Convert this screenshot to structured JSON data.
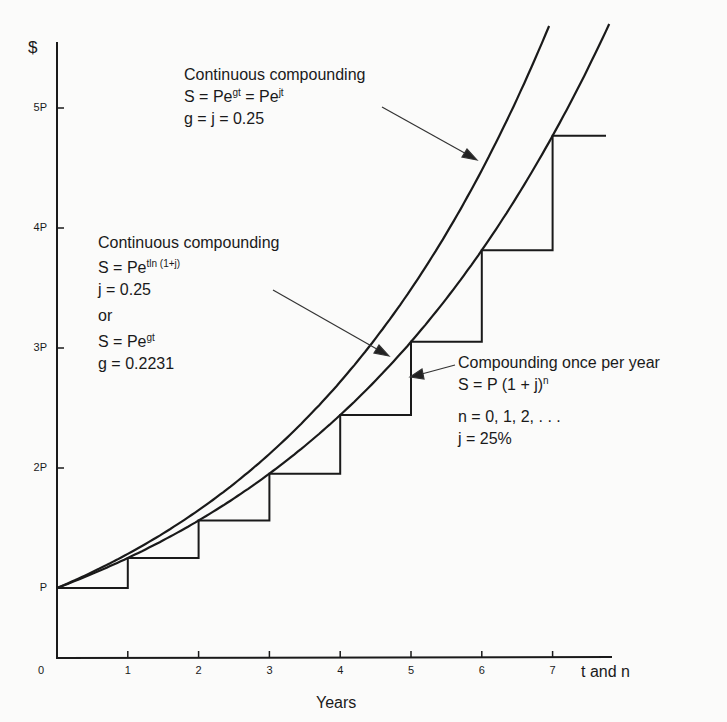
{
  "chart_data": {
    "type": "line",
    "title": "",
    "xlabel": "Years",
    "x_axis_end_label": "t and n",
    "ylabel": "$",
    "x_ticks": [
      "0",
      "1",
      "2",
      "3",
      "4",
      "5",
      "6",
      "7"
    ],
    "y_ticks": [
      "P",
      "2P",
      "3P",
      "4P",
      "5P"
    ],
    "y_units": "multiples of principal P",
    "grid": false,
    "series": [
      {
        "name": "Continuous compounding, g = j = 0.25",
        "formula": "S = Pe^gt = Pe^jt",
        "style": "smooth curve",
        "x": [
          0,
          1,
          2,
          3,
          4,
          5,
          6,
          7
        ],
        "values": [
          1.0,
          1.284,
          1.649,
          2.117,
          2.718,
          3.49,
          4.482,
          5.755
        ]
      },
      {
        "name": "Continuous compounding, g = 0.2231 (j = 0.25)",
        "formula": "S = Pe^(t ln(1+j)) = Pe^gt",
        "style": "smooth curve",
        "x": [
          0,
          1,
          2,
          3,
          4,
          5,
          6,
          7,
          7.8
        ],
        "values": [
          1.0,
          1.25,
          1.5625,
          1.953,
          2.441,
          3.052,
          3.815,
          4.768,
          5.7
        ]
      },
      {
        "name": "Compounding once per year, j = 25%",
        "formula": "S = P(1 + j)^n",
        "style": "step",
        "x": [
          0,
          1,
          2,
          3,
          4,
          5,
          6,
          7
        ],
        "values": [
          1.0,
          1.25,
          1.5625,
          1.953,
          2.441,
          3.052,
          3.815,
          4.768
        ]
      }
    ],
    "annotations": [
      {
        "lines": [
          "Continuous compounding",
          "S = Pe^gt = Pe^jt",
          "g = j = 0.25"
        ],
        "points_to": "upper curve"
      },
      {
        "lines": [
          "Continuous compounding",
          "S = Pe^(t ln(1+j))",
          "j = 0.25",
          "or",
          "S = Pe^gt",
          "g = 0.2231"
        ],
        "points_to": "lower curve"
      },
      {
        "lines": [
          "Compounding once per year",
          "S = P (1 + j)^n",
          "n = 0, 1, 2, . . .",
          "j = 25%"
        ],
        "points_to": "step function"
      }
    ]
  },
  "axes": {
    "y_symbol": "$",
    "origin": "0",
    "x_ticks": [
      "1",
      "2",
      "3",
      "4",
      "5",
      "6",
      "7"
    ],
    "x_end": "t and n",
    "x_title": "Years",
    "y_ticks": [
      "P",
      "2P",
      "3P",
      "4P",
      "5P"
    ]
  },
  "ann1": {
    "title": "Continuous compounding",
    "eq_a": "S = Pe",
    "eq_a_sup": "gt",
    "eq_b": " = Pe",
    "eq_b_sup": "jt",
    "param": "g = j = 0.25"
  },
  "ann2": {
    "title": "Continuous compounding",
    "eq1": "S = Pe",
    "eq1_sup": "tln (1+j)",
    "param1": "j = 0.25",
    "or": "or",
    "eq2": "S = Pe",
    "eq2_sup": "gt",
    "param2": "g = 0.2231"
  },
  "ann3": {
    "title": "Compounding once per year",
    "eq": "S = P (1 + j)",
    "eq_sup": "n",
    "n_values": "n = 0, 1, 2, . . .",
    "rate": "j = 25%"
  }
}
